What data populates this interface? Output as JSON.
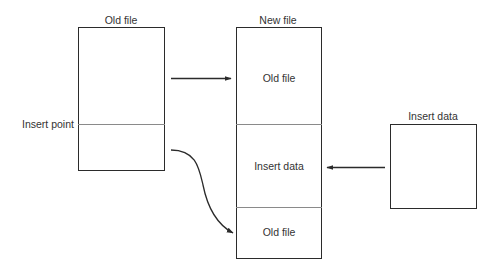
{
  "diagram": {
    "old_file": {
      "title": "Old file",
      "insert_point_label": "Insert point"
    },
    "new_file": {
      "title": "New file",
      "segments": [
        {
          "label": "Old file"
        },
        {
          "label": "Insert data"
        },
        {
          "label": "Old file"
        }
      ]
    },
    "insert_data": {
      "title": "Insert data"
    },
    "arrows": [
      {
        "from": "old-file-top",
        "to": "new-file-segment-1",
        "shape": "straight"
      },
      {
        "from": "old-file-bottom",
        "to": "new-file-segment-3",
        "shape": "curved"
      },
      {
        "from": "insert-data-box",
        "to": "new-file-segment-2",
        "shape": "straight"
      }
    ],
    "colors": {
      "line": "#2b2b2b",
      "divider": "#8a8a8a",
      "background": "#ffffff"
    }
  }
}
